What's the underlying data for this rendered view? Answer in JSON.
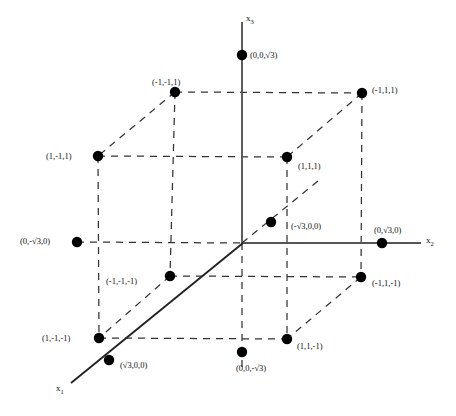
{
  "figure": {
    "name": "cube-vertices-and-axis-points-3d-diagram",
    "background": "#ffffff",
    "ink": "#111111",
    "axis_color": "#555555",
    "dash_color": "#333333",
    "point_color": "#000000",
    "width": 456,
    "height": 416
  },
  "axes": [
    {
      "id": "x1",
      "label": "x",
      "subscript": "1",
      "x": 62,
      "y": 388,
      "kind": "solid-axis"
    },
    {
      "id": "x2",
      "label": "x",
      "subscript": "2",
      "x": 428,
      "y": 239,
      "kind": "solid-axis"
    },
    {
      "id": "x3",
      "label": "x",
      "subscript": "3",
      "x": 246,
      "y": 16,
      "kind": "solid-axis"
    }
  ],
  "origin": {
    "x": 242,
    "y": 243
  },
  "points": [
    {
      "name": "point-0-0-sqrt3",
      "label": "(0,0,√3)",
      "x": 242,
      "y": 55,
      "lx": 250,
      "ly": 51,
      "align": "left"
    },
    {
      "name": "point-m1-m1-1",
      "label": "(-1,-1,1)",
      "x": 175,
      "y": 92,
      "lx": 152,
      "ly": 78,
      "align": "left"
    },
    {
      "name": "point-m1-1-1",
      "label": "(-1,1,1)",
      "x": 362,
      "y": 93,
      "lx": 372,
      "ly": 86,
      "align": "left"
    },
    {
      "name": "point-1-m1-1",
      "label": "(1,-1,1)",
      "x": 98,
      "y": 156,
      "lx": 46,
      "ly": 152,
      "align": "left"
    },
    {
      "name": "point-1-1-1",
      "label": "(1,1,1)",
      "x": 287,
      "y": 157,
      "lx": 298,
      "ly": 162,
      "align": "left"
    },
    {
      "name": "point-msqrt3-0-0",
      "label": "(-√3,0,0)",
      "x": 271,
      "y": 222,
      "lx": 291,
      "ly": 222,
      "align": "left"
    },
    {
      "name": "point-0-msqrt3-0",
      "label": "(0,-√3,0)",
      "x": 77,
      "y": 242,
      "lx": 20,
      "ly": 237,
      "align": "left"
    },
    {
      "name": "point-0-sqrt3-0",
      "label": "(0,√3,0)",
      "x": 382,
      "y": 243,
      "lx": 374,
      "ly": 226,
      "align": "left"
    },
    {
      "name": "point-m1-m1-m1",
      "label": "(-1,-1,-1)",
      "x": 170,
      "y": 276,
      "lx": 106,
      "ly": 277,
      "align": "left"
    },
    {
      "name": "point-m1-1-m1",
      "label": "(-1,1,-1)",
      "x": 361,
      "y": 277,
      "lx": 372,
      "ly": 279,
      "align": "left"
    },
    {
      "name": "point-1-m1-m1",
      "label": "(1,-1,-1)",
      "x": 99,
      "y": 338,
      "lx": 42,
      "ly": 334,
      "align": "left"
    },
    {
      "name": "point-1-1-m1",
      "label": "(1,1,-1)",
      "x": 287,
      "y": 339,
      "lx": 297,
      "ly": 342,
      "align": "left"
    },
    {
      "name": "point-sqrt3-0-0",
      "label": "(√3,0,0)",
      "x": 109,
      "y": 360,
      "lx": 120,
      "ly": 361,
      "align": "left"
    },
    {
      "name": "point-0-0-msqrt3",
      "label": "(0,0,-√3)",
      "x": 242,
      "y": 352,
      "lx": 236,
      "ly": 364,
      "align": "left"
    }
  ],
  "chart_data": {
    "type": "scatter",
    "title": "",
    "xlabel": "x2",
    "ylabel": "x3",
    "zlabel": "x1",
    "projection": "3d-oblique",
    "cube_vertices": [
      {
        "coords": [
          -1,
          -1,
          1
        ],
        "px": 175,
        "py": 92
      },
      {
        "coords": [
          -1,
          1,
          1
        ],
        "px": 362,
        "py": 93
      },
      {
        "coords": [
          1,
          -1,
          1
        ],
        "px": 98,
        "py": 156
      },
      {
        "coords": [
          1,
          1,
          1
        ],
        "px": 287,
        "py": 157
      },
      {
        "coords": [
          -1,
          -1,
          -1
        ],
        "px": 170,
        "py": 276
      },
      {
        "coords": [
          -1,
          1,
          -1
        ],
        "px": 361,
        "py": 277
      },
      {
        "coords": [
          1,
          -1,
          -1
        ],
        "px": 99,
        "py": 338
      },
      {
        "coords": [
          1,
          1,
          -1
        ],
        "px": 287,
        "py": 339
      }
    ],
    "axis_points": [
      {
        "coords": [
          0,
          0,
          1.732
        ],
        "label": "(0,0,√3)",
        "px": 242,
        "py": 55
      },
      {
        "coords": [
          0,
          0,
          -1.732
        ],
        "label": "(0,0,-√3)",
        "px": 242,
        "py": 352
      },
      {
        "coords": [
          0,
          1.732,
          0
        ],
        "label": "(0,√3,0)",
        "px": 382,
        "py": 243
      },
      {
        "coords": [
          0,
          -1.732,
          0
        ],
        "label": "(0,-√3,0)",
        "px": 77,
        "py": 242
      },
      {
        "coords": [
          1.732,
          0,
          0
        ],
        "label": "(√3,0,0)",
        "px": 109,
        "py": 360
      },
      {
        "coords": [
          -1.732,
          0,
          0
        ],
        "label": "(-√3,0,0)",
        "px": 271,
        "py": 222
      }
    ],
    "lines": {
      "solid_axes": [
        {
          "name": "x3-axis",
          "from": [
            242,
            22
          ],
          "to": [
            242,
            243
          ]
        },
        {
          "name": "x2-axis",
          "from": [
            242,
            243
          ],
          "to": [
            420,
            243
          ]
        },
        {
          "name": "x1-axis-positive",
          "from": [
            242,
            243
          ],
          "to": [
            72,
            382
          ]
        }
      ],
      "dashed_diagonal": {
        "name": "negative-x1-ray",
        "from": [
          242,
          243
        ],
        "to": [
          315,
          183
        ]
      }
    },
    "grid": false,
    "legend": null
  }
}
